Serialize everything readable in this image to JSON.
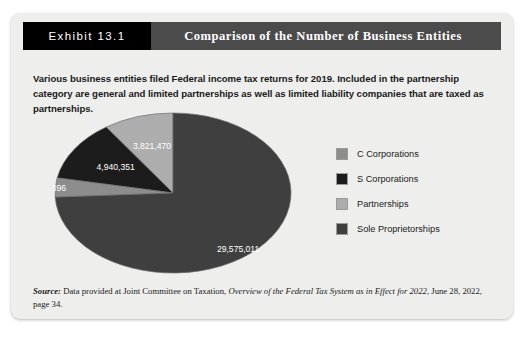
{
  "exhibit": {
    "number_label": "Exhibit 13.1",
    "title": "Comparison of the Number of Business Entities",
    "intro": "Various business entities filed Federal income tax returns for 2019. Included in the partnership category are general and limited partnerships as well as limited liability companies that are taxed as partnerships."
  },
  "source": {
    "label": "Source:",
    "text_before_italic": " Data provided at Joint Committee on Taxation, ",
    "italic_text": "Overview of the Federal Tax System as in Effect for 2022",
    "text_after_italic": ", June 28, 2022, page 34."
  },
  "colors": {
    "card_background": "#eeeeec",
    "header_bar": "#4b4b4b",
    "number_block": "#000000",
    "c_corporations": "#8d8d8d",
    "s_corporations": "#1c1c1c",
    "partnerships": "#adadad",
    "sole_proprietorships": "#3f3f3f"
  },
  "chart_data": {
    "type": "pie",
    "title": "Comparison of the Number of Business Entities",
    "legend_position": "right",
    "total": 39870228,
    "categories": [
      "C Corporations",
      "S Corporations",
      "Partnerships",
      "Sole Proprietorships"
    ],
    "values": [
      1533396,
      4940351,
      3821470,
      29575011
    ],
    "value_labels": [
      "1,533,396",
      "4,940,351",
      "3,821,470",
      "29,575,011"
    ],
    "percentages": [
      3.85,
      12.39,
      9.58,
      74.18
    ],
    "slice_colors": [
      "#8d8d8d",
      "#1c1c1c",
      "#adadad",
      "#3f3f3f"
    ],
    "slice_label_colors": [
      "#2a2a2a",
      "#ffffff",
      "#2a2a2a",
      "#ffffff"
    ],
    "start_angle_deg": 90,
    "direction": "counterclockwise"
  },
  "legend": {
    "items": [
      {
        "label": "C Corporations",
        "color": "#8d8d8d"
      },
      {
        "label": "S Corporations",
        "color": "#1c1c1c"
      },
      {
        "label": "Partnerships",
        "color": "#adadad"
      },
      {
        "label": "Sole Proprietorships",
        "color": "#3f3f3f"
      }
    ]
  }
}
